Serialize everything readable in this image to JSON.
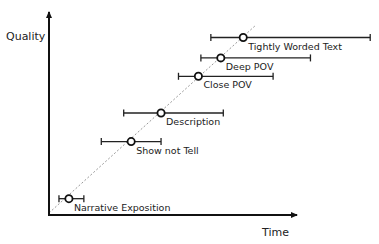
{
  "chart_data": {
    "type": "scatter",
    "title": "",
    "xlabel": "Time",
    "ylabel": "Quality",
    "xlim": [
      0,
      100
    ],
    "ylim": [
      0,
      100
    ],
    "grid": false,
    "legend": "none",
    "trend_line": {
      "style": "dashed",
      "from": [
        0,
        1
      ],
      "to": [
        83,
        93
      ]
    },
    "points": [
      {
        "label": "Narrative Exposition",
        "x": 8,
        "y": 8,
        "xerr_low": 4,
        "xerr_high": 14
      },
      {
        "label": "Show not Tell",
        "x": 33,
        "y": 36,
        "xerr_low": 21,
        "xerr_high": 45
      },
      {
        "label": "Description",
        "x": 45,
        "y": 50,
        "xerr_low": 30,
        "xerr_high": 70
      },
      {
        "label": "Close POV",
        "x": 60,
        "y": 68,
        "xerr_low": 52,
        "xerr_high": 90
      },
      {
        "label": "Deep POV",
        "x": 69,
        "y": 77,
        "xerr_low": 61,
        "xerr_high": 105
      },
      {
        "label": "Tightly Worded Text",
        "x": 78,
        "y": 87,
        "xerr_low": 65,
        "xerr_high": 129
      }
    ]
  }
}
